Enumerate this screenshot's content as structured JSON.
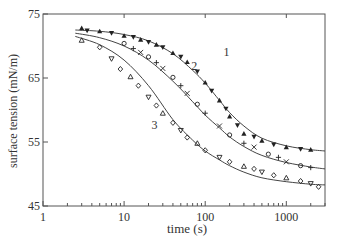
{
  "chart_data": {
    "type": "scatter",
    "title": "",
    "xlabel": "time (s)",
    "ylabel": "surface tension (mN/m)",
    "xscale": "log",
    "xlim": [
      1,
      3000
    ],
    "ylim": [
      45,
      75
    ],
    "x_ticks": [
      "1",
      "10",
      "100",
      "1000"
    ],
    "y_ticks": [
      "45",
      "55",
      "65",
      "75"
    ],
    "grid": false,
    "legend": null,
    "annotations": [
      "1",
      "2",
      "3"
    ],
    "fit_curves": [
      {
        "name": "1",
        "x": [
          2.5,
          5,
          10,
          20,
          40,
          70,
          100,
          150,
          200,
          300,
          500,
          1000,
          2000,
          3000
        ],
        "y": [
          72.5,
          72.3,
          71.8,
          70.8,
          68.8,
          66.2,
          64.2,
          61.5,
          59.6,
          57.5,
          55.6,
          54.4,
          53.8,
          53.6
        ]
      },
      {
        "name": "2",
        "x": [
          2.5,
          5,
          10,
          20,
          40,
          70,
          100,
          150,
          200,
          300,
          500,
          1000,
          2000,
          3000
        ],
        "y": [
          72.0,
          71.3,
          70.0,
          67.8,
          64.5,
          61.3,
          59.2,
          57.2,
          55.8,
          54.3,
          52.9,
          51.8,
          51.1,
          50.8
        ]
      },
      {
        "name": "3",
        "x": [
          2.5,
          5,
          10,
          20,
          40,
          70,
          100,
          150,
          200,
          300,
          500,
          1000,
          2000,
          3000
        ],
        "y": [
          71.5,
          70.2,
          67.8,
          63.8,
          58.5,
          55.3,
          53.6,
          52.2,
          51.3,
          50.3,
          49.4,
          48.8,
          48.4,
          48.3
        ]
      }
    ],
    "series": [
      {
        "name": "1",
        "marker": "filled-triangle",
        "x": [
          3,
          3.5,
          5,
          7,
          10,
          13,
          16,
          20,
          25,
          30,
          40,
          50,
          60,
          80,
          100,
          120,
          150,
          180,
          200,
          250,
          300,
          400,
          500,
          700,
          1000,
          1500,
          2000
        ],
        "y": [
          72.8,
          72.4,
          72.3,
          72.0,
          71.6,
          71.4,
          71.0,
          70.6,
          70.2,
          69.8,
          68.9,
          68.3,
          67.5,
          66.0,
          64.3,
          63.0,
          61.5,
          60.2,
          59.0,
          57.6,
          56.3,
          55.8,
          55.2,
          54.6,
          54.2,
          53.9,
          53.8
        ]
      },
      {
        "name": "2",
        "marker": "open-circle/cross",
        "x": [
          10,
          13,
          16,
          20,
          25,
          30,
          40,
          50,
          60,
          80,
          100,
          150,
          200,
          300,
          400,
          600,
          800,
          1000,
          1500,
          2000
        ],
        "y": [
          70.4,
          69.6,
          69.0,
          68.3,
          67.4,
          66.5,
          65.1,
          63.8,
          62.6,
          60.9,
          59.5,
          57.5,
          56.1,
          54.8,
          54.2,
          53.1,
          52.6,
          51.9,
          51.3,
          51.0
        ]
      },
      {
        "name": "3",
        "marker": "open-triangle/diamond",
        "x": [
          3,
          5,
          7,
          9,
          12,
          15,
          20,
          25,
          30,
          40,
          50,
          60,
          80,
          100,
          150,
          200,
          300,
          400,
          500,
          700,
          1000,
          1500,
          2000,
          2500
        ],
        "y": [
          70.9,
          69.8,
          68.0,
          66.4,
          65.2,
          63.8,
          62.0,
          60.7,
          59.5,
          58.0,
          56.8,
          55.7,
          54.8,
          53.7,
          52.6,
          51.9,
          51.2,
          50.8,
          50.3,
          49.8,
          49.4,
          48.9,
          48.5,
          48.0
        ]
      }
    ]
  },
  "layout": {
    "plot_left": 43,
    "plot_right": 325,
    "plot_top": 14,
    "plot_bottom": 206,
    "x_max_decades": 3.477
  },
  "colors": {
    "axis": "#555555",
    "curve": "#444444",
    "marker": "#222222"
  }
}
